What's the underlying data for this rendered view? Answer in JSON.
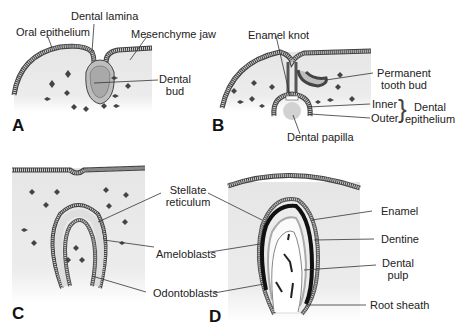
{
  "figure": {
    "panels": [
      {
        "letter": "A",
        "labels": {
          "oral_epithelium": "Oral epithelium",
          "dental_lamina": "Dental lamina",
          "mesenchyme_jaw": "Mesenchyme jaw",
          "dental_bud_line1": "Dental",
          "dental_bud_line2": "bud"
        }
      },
      {
        "letter": "B",
        "labels": {
          "enamel_knot": "Enamel knot",
          "permanent_tooth_bud_line1": "Permanent",
          "permanent_tooth_bud_line2": "tooth bud",
          "inner": "Inner",
          "outer": "Outer",
          "dental_epithelium_line1": "Dental",
          "dental_epithelium_line2": "epithelium",
          "dental_papilla": "Dental papilla"
        }
      },
      {
        "letter": "C",
        "labels": {
          "stellate_reticulum_line1": "Stellate",
          "stellate_reticulum_line2": "reticulum",
          "ameloblasts": "Ameloblasts",
          "odontoblasts": "Odontoblasts"
        }
      },
      {
        "letter": "D",
        "labels": {
          "enamel": "Enamel",
          "dentine": "Dentine",
          "dental_pulp_line1": "Dental",
          "dental_pulp_line2": "pulp",
          "root_sheath": "Root sheath"
        }
      }
    ],
    "colors": {
      "tissue_fill": "#e9e9e9",
      "epithelium": "#b9b9b9",
      "enamel": "#111111",
      "lines": "#333333"
    }
  }
}
